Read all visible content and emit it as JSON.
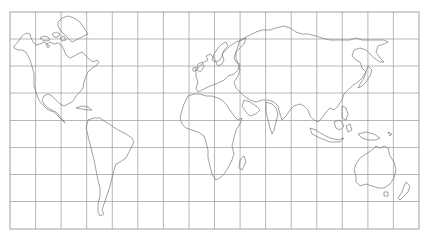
{
  "map": {
    "projection": "equirectangular world outline",
    "background": "#ffffff",
    "grid_color": "#9a9a9a",
    "coast_color": "#7a7a7a",
    "frame": {
      "left": 10,
      "top": 12,
      "right": 419,
      "bottom": 229
    },
    "grid": {
      "columns": 16,
      "rows": 8,
      "vertical_x": [
        35.6,
        61.1,
        86.7,
        112.3,
        137.8,
        163.4,
        189,
        214.5,
        240.1,
        265.6,
        291.2,
        316.8,
        342.3,
        367.9,
        393.4
      ],
      "horizontal_y": [
        39,
        66,
        93,
        120.5,
        147.5,
        174.5,
        201.5
      ]
    },
    "regions": [
      {
        "name": "North America"
      },
      {
        "name": "Greenland"
      },
      {
        "name": "South America"
      },
      {
        "name": "Europe"
      },
      {
        "name": "Africa"
      },
      {
        "name": "Asia"
      },
      {
        "name": "Australia"
      },
      {
        "name": "New Zealand"
      }
    ]
  }
}
